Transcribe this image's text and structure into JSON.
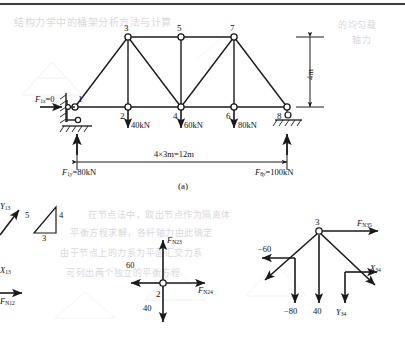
{
  "figure": {
    "caption": "(a)",
    "title_part": "truss-structure-analysis"
  },
  "truss": {
    "nodes": [
      {
        "id": "1",
        "label": "1",
        "x": 75,
        "y": 107
      },
      {
        "id": "2",
        "label": "2",
        "x": 128,
        "y": 107
      },
      {
        "id": "3",
        "label": "3",
        "x": 128,
        "y": 37
      },
      {
        "id": "4",
        "label": "4",
        "x": 181,
        "y": 107
      },
      {
        "id": "5",
        "label": "5",
        "x": 181,
        "y": 37
      },
      {
        "id": "6",
        "label": "6",
        "x": 234,
        "y": 107
      },
      {
        "id": "7",
        "label": "7",
        "x": 234,
        "y": 37
      },
      {
        "id": "8",
        "label": "8",
        "x": 287,
        "y": 107
      }
    ],
    "members": [
      [
        "1",
        "2"
      ],
      [
        "2",
        "4"
      ],
      [
        "4",
        "6"
      ],
      [
        "6",
        "8"
      ],
      [
        "3",
        "5"
      ],
      [
        "5",
        "7"
      ],
      [
        "1",
        "3"
      ],
      [
        "2",
        "3"
      ],
      [
        "3",
        "4"
      ],
      [
        "4",
        "5"
      ],
      [
        "4",
        "7"
      ],
      [
        "6",
        "7"
      ],
      [
        "7",
        "8"
      ]
    ]
  },
  "supports": {
    "left": {
      "type": "pin-support",
      "node": "1"
    },
    "right": {
      "type": "roller-support",
      "node": "8"
    }
  },
  "loads": [
    {
      "name": "load-at-node-2",
      "label": "40kN",
      "node": "2",
      "direction": "down"
    },
    {
      "name": "load-at-node-4",
      "label": "60kN",
      "node": "4",
      "direction": "down"
    },
    {
      "name": "load-at-node-6",
      "label": "80kN",
      "node": "6",
      "direction": "down"
    }
  ],
  "reactions": {
    "horizontal_at_1": {
      "label": "F",
      "sub": "1x",
      "value": "=0",
      "full": "F1x=0"
    },
    "vertical_at_1": {
      "label": "F",
      "sub": "1y",
      "value": "=80kN",
      "full": "F1y=80kN"
    },
    "vertical_at_8": {
      "label": "F",
      "sub": "8y",
      "value": "=100kN",
      "full": "F8y=100kN"
    }
  },
  "dimensions": {
    "span": "4×3m=12m",
    "height": "4m"
  },
  "slope_triangle": {
    "hypotenuse": "5",
    "vertical": "4",
    "horizontal": "3"
  },
  "fbd_node1": {
    "name": "free-body-diagram-node-1",
    "labels": {
      "y13": {
        "base": "Y",
        "sub": "13"
      },
      "x13": {
        "base": "X",
        "sub": "13"
      },
      "fn12": {
        "base": "F",
        "sub": "N12"
      }
    }
  },
  "fbd_node2": {
    "name": "free-body-diagram-node-2",
    "node_label": "2",
    "labels": {
      "fn23": {
        "base": "F",
        "sub": "N23"
      },
      "fn24": {
        "base": "F",
        "sub": "N24"
      },
      "left_force": "60",
      "down_force": "40"
    }
  },
  "fbd_node3": {
    "name": "free-body-diagram-node-3",
    "node_label": "3",
    "labels": {
      "fn35": {
        "base": "F",
        "sub": "N35"
      },
      "x34": {
        "base": "X",
        "sub": "34"
      },
      "y34": {
        "base": "Y",
        "sub": "34"
      },
      "left_force": "−60",
      "down_force_1": "−80",
      "down_force_2": "40"
    }
  },
  "colors": {
    "line": "#1a1a1a",
    "text": "#111111",
    "ghost": "#d9d9dc",
    "background": "#ffffff"
  },
  "ghost_text": {
    "line_top": "结构力学中的桶架分析方法与计算",
    "line_r1": "的均匀载",
    "line_r2": "轴力",
    "block_1": "在节点法中，取出节点作为隔离体",
    "block_2": "平衡方程求解，各杆轴力由此确定",
    "block_3": "由于节点上的力系为平面汇交力系",
    "block_4": "可列出两个独立的平衡方程"
  }
}
